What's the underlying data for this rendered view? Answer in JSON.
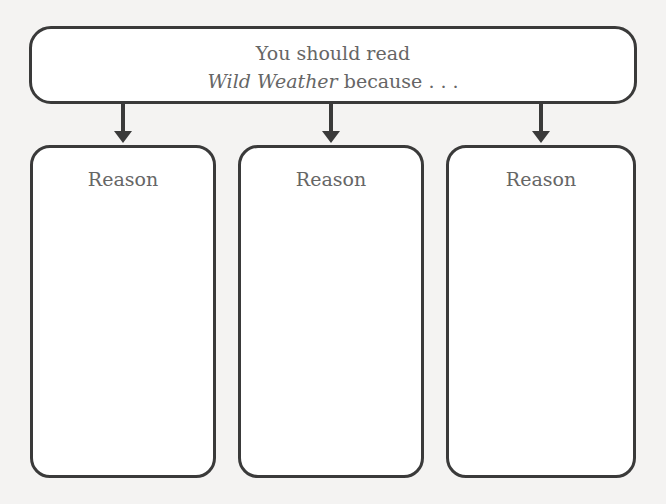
{
  "header": {
    "line1": "You should read",
    "title_italic": "Wild Weather",
    "line2_rest": " because . . ."
  },
  "reasons": [
    {
      "label": "Reason"
    },
    {
      "label": "Reason"
    },
    {
      "label": "Reason"
    }
  ],
  "colors": {
    "stroke": "#3a3a3a",
    "text": "#666666",
    "background": "#f4f3f2"
  }
}
